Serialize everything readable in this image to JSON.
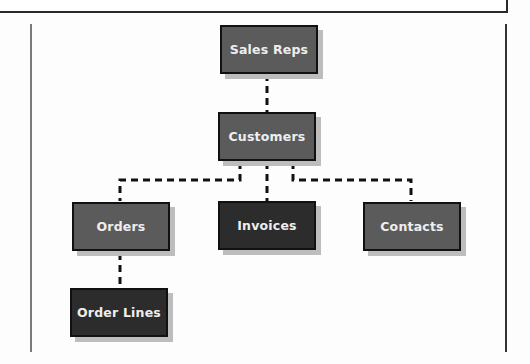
{
  "diagram": {
    "type": "hierarchy",
    "nodes": [
      {
        "id": "sales_reps",
        "label": "Sales Reps",
        "shade": "light"
      },
      {
        "id": "customers",
        "label": "Customers",
        "shade": "light"
      },
      {
        "id": "orders",
        "label": "Orders",
        "shade": "light"
      },
      {
        "id": "invoices",
        "label": "Invoices",
        "shade": "dark"
      },
      {
        "id": "contacts",
        "label": "Contacts",
        "shade": "light"
      },
      {
        "id": "order_lines",
        "label": "Order Lines",
        "shade": "dark"
      }
    ],
    "edges": [
      {
        "from": "sales_reps",
        "to": "customers",
        "style": "dashed"
      },
      {
        "from": "customers",
        "to": "orders",
        "style": "dashed"
      },
      {
        "from": "customers",
        "to": "invoices",
        "style": "dashed"
      },
      {
        "from": "customers",
        "to": "contacts",
        "style": "dashed"
      },
      {
        "from": "orders",
        "to": "order_lines",
        "style": "dashed"
      }
    ],
    "colors": {
      "light_node": "#5b5b5b",
      "dark_node": "#2c2c2c",
      "text": "#eeeeee",
      "border": "#111111"
    }
  }
}
